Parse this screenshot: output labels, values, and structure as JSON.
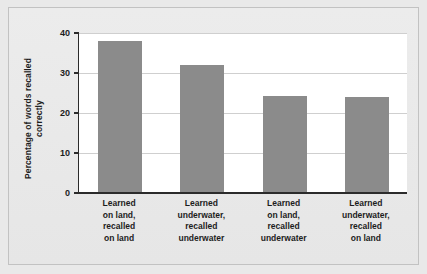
{
  "chart_data": {
    "type": "bar",
    "title": "",
    "subtitle": "",
    "xlabel": "",
    "ylabel": "Percentage of words recalled correctly",
    "ylabel_lines": [
      "Percentage of words",
      "recalled correctly"
    ],
    "categories": [
      "Learned on land, recalled on land",
      "Learned underwater, recalled underwater",
      "Learned on land, recalled underwater",
      "Learned underwater, recalled on land"
    ],
    "category_lines": [
      [
        "Learned",
        "on land,",
        "recalled",
        "on land"
      ],
      [
        "Learned",
        "underwater,",
        "recalled",
        "underwater"
      ],
      [
        "Learned",
        "on land,",
        "recalled",
        "underwater"
      ],
      [
        "Learned",
        "underwater,",
        "recalled",
        "on land"
      ]
    ],
    "values": [
      38,
      32,
      24.3,
      23.9
    ],
    "ylim": [
      0,
      40
    ],
    "yticks": [
      0,
      10,
      20,
      30,
      40
    ],
    "ytick_labels": [
      "0",
      "10",
      "20",
      "30",
      "40"
    ],
    "grid": "horizontal",
    "legend": "none",
    "colors": {
      "bar": "#8b8b8b",
      "plot_background": "#ffffff",
      "figure_background": "#e9e9e9",
      "axis": "#2b2b2b",
      "gridline": "#cfcfcf",
      "text": "#1d1d1d"
    }
  }
}
